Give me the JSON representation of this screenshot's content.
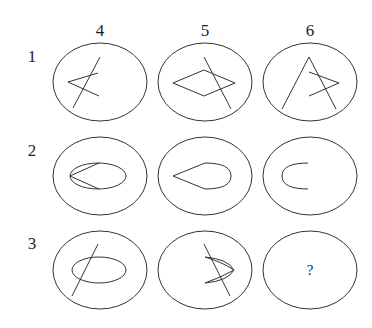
{
  "puzzle": {
    "column_labels": [
      "4",
      "5",
      "6"
    ],
    "row_labels": [
      "1",
      "2",
      "3"
    ],
    "missing_cell_label": "?",
    "cells": [
      {
        "row": "1",
        "col": "4",
        "description": "left-pointing V crossed by a slanted line"
      },
      {
        "row": "1",
        "col": "5",
        "description": "diamond crossed by a slanted line"
      },
      {
        "row": "1",
        "col": "6",
        "description": "lambda shape with right-pointing V"
      },
      {
        "row": "2",
        "col": "4",
        "description": "ellipse with two lines forming a point on left"
      },
      {
        "row": "2",
        "col": "5",
        "description": "teardrop shape pointing left"
      },
      {
        "row": "2",
        "col": "6",
        "description": "C-shaped arc opening right"
      },
      {
        "row": "3",
        "col": "4",
        "description": "ellipse crossed by a slanted line"
      },
      {
        "row": "3",
        "col": "5",
        "description": "right-pointing curved V crossed by a slanted line"
      },
      {
        "row": "3",
        "col": "6",
        "description": "missing (question mark)"
      }
    ]
  }
}
